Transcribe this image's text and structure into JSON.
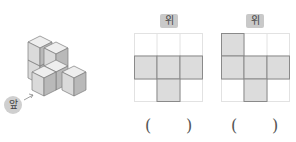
{
  "figure": {
    "front_label": "앞",
    "cube_count_visible": 6
  },
  "options": [
    {
      "top_label": "위",
      "grid": {
        "rows": 3,
        "cols": 3,
        "filled": [
          [
            1,
            0
          ],
          [
            1,
            1
          ],
          [
            1,
            2
          ],
          [
            2,
            1
          ]
        ]
      },
      "answer_open": "(",
      "answer_close": ")"
    },
    {
      "top_label": "위",
      "grid": {
        "rows": 3,
        "cols": 3,
        "filled": [
          [
            0,
            0
          ],
          [
            1,
            0
          ],
          [
            1,
            1
          ],
          [
            1,
            2
          ],
          [
            2,
            1
          ]
        ]
      },
      "answer_open": "(",
      "answer_close": ")"
    }
  ],
  "colors": {
    "fill": "#dcdcdc",
    "grid_line": "#e2e2e2",
    "shape_border": "#8a8a8a",
    "badge": "#c9c9c9"
  }
}
